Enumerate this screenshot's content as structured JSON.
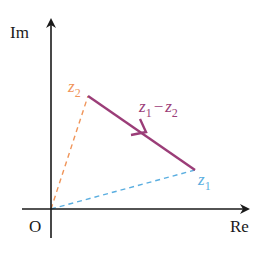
{
  "diagram": {
    "type": "complex-plane-vector-diagram",
    "axes": {
      "x_label": "Re",
      "y_label": "Im",
      "origin_label": "O",
      "color": "#1a1a1a"
    },
    "points": [
      {
        "id": "z1",
        "label": "z",
        "subscript": "1",
        "color": "#5aaee0"
      },
      {
        "id": "z2",
        "label": "z",
        "subscript": "2",
        "color": "#f0955a"
      }
    ],
    "vector": {
      "label_a": "z",
      "sub_a": "1",
      "op": "−",
      "label_b": "z",
      "sub_b": "2",
      "from": "z2",
      "to": "z1",
      "color": "#9b3d78"
    },
    "dashed_segments": [
      {
        "from": "O",
        "to": "z1",
        "color": "#5aaee0"
      },
      {
        "from": "O",
        "to": "z2",
        "color": "#f0955a"
      }
    ]
  }
}
